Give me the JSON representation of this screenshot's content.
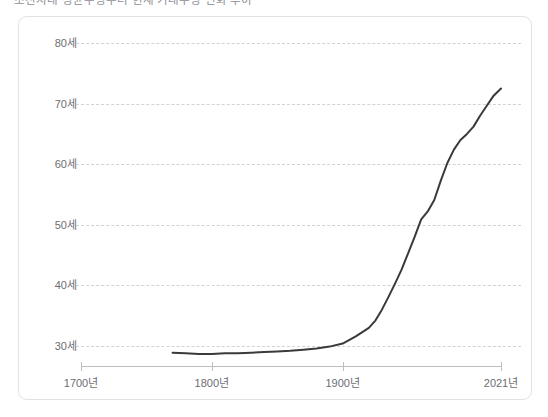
{
  "chart_title": "조선시대 평균수명부터 현재 기대수명 변화 추이",
  "card": {
    "background": "#ffffff",
    "border_color": "#e2e2e4"
  },
  "chart_data": {
    "type": "line",
    "title": "조선시대 평균수명부터 현재 기대수명 변화 추이",
    "xlabel": "",
    "ylabel": "",
    "grid": true,
    "legend": null,
    "line_color": "#3a3a3a",
    "grid_color": "#d2d2d6",
    "axis_color": "#bdbdc2",
    "xlim": [
      1700,
      2021
    ],
    "ylim": [
      26,
      82
    ],
    "y_ticks": [
      30,
      40,
      50,
      60,
      70,
      80
    ],
    "y_tick_labels": [
      "30세",
      "40세",
      "50세",
      "60세",
      "70세",
      "80세"
    ],
    "x_ticks": [
      1700,
      1800,
      1900,
      2021
    ],
    "x_tick_labels": [
      "1700년",
      "1800년",
      "1900년",
      "2021년"
    ],
    "series": [
      {
        "name": "기대수명",
        "x": [
          1770,
          1780,
          1790,
          1800,
          1810,
          1820,
          1830,
          1840,
          1850,
          1860,
          1870,
          1880,
          1890,
          1900,
          1910,
          1920,
          1925,
          1930,
          1935,
          1940,
          1945,
          1950,
          1955,
          1960,
          1965,
          1970,
          1975,
          1980,
          1985,
          1990,
          1995,
          2000,
          2005,
          2010,
          2015,
          2021
        ],
        "y": [
          28.9,
          28.8,
          28.7,
          28.7,
          28.8,
          28.8,
          28.9,
          29.0,
          29.1,
          29.2,
          29.4,
          29.6,
          29.9,
          30.4,
          31.6,
          33.0,
          34.2,
          36.0,
          38.1,
          40.3,
          42.6,
          45.3,
          48.0,
          50.9,
          52.2,
          54.1,
          57.3,
          60.2,
          62.4,
          64.0,
          65.0,
          66.2,
          68.0,
          69.6,
          71.2,
          72.5
        ]
      }
    ]
  },
  "y_axis": {
    "labels": [
      {
        "text": "80세",
        "value": 80
      },
      {
        "text": "70세",
        "value": 70
      },
      {
        "text": "60세",
        "value": 60
      },
      {
        "text": "50세",
        "value": 50
      },
      {
        "text": "40세",
        "value": 40
      },
      {
        "text": "30세",
        "value": 30
      }
    ]
  },
  "x_axis": {
    "labels": [
      {
        "text": "1700년",
        "value": 1700
      },
      {
        "text": "1800년",
        "value": 1800
      },
      {
        "text": "1900년",
        "value": 1900
      },
      {
        "text": "2021년",
        "value": 2021
      }
    ]
  }
}
